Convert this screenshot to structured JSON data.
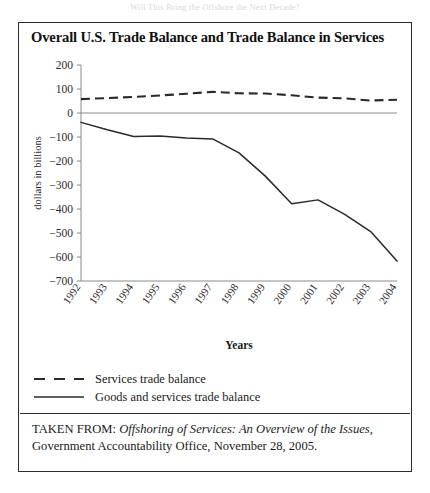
{
  "running_header": "Will This Bring the Offshore the Next Decade?",
  "figure": {
    "title": "Overall U.S. Trade Balance and Trade Balance in Services",
    "caption_prefix": "TAKEN FROM: ",
    "caption_source_title": "Offshoring of Services: An Overview of the Issues,",
    "caption_rest": "Government Accountability Office, November 28, 2005."
  },
  "legend": {
    "position": "below-plot",
    "items": [
      {
        "label": "Services trade balance",
        "style": "dashed",
        "color": "#2a2a2a"
      },
      {
        "label": "Goods and services trade balance",
        "style": "solid",
        "color": "#2a2a2a"
      }
    ]
  },
  "chart_data": {
    "type": "line",
    "title": "Overall U.S. Trade Balance and Trade Balance in Services",
    "xlabel": "Years",
    "ylabel": "dollars in billions",
    "x": [
      1992,
      1993,
      1994,
      1995,
      1996,
      1997,
      1998,
      1999,
      2000,
      2001,
      2002,
      2003,
      2004
    ],
    "xtick_labels": [
      "1992",
      "1993",
      "1994",
      "1995",
      "1996",
      "1997",
      "1998",
      "1999",
      "2000",
      "2001",
      "2002",
      "2003",
      "2004"
    ],
    "ytick_labels": [
      "200",
      "100",
      "0",
      "−100",
      "−200",
      "−300",
      "−400",
      "−500",
      "−600",
      "−700"
    ],
    "yticks": [
      200,
      100,
      0,
      -100,
      -200,
      -300,
      -400,
      -500,
      -600,
      -700
    ],
    "ylim": [
      -700,
      200
    ],
    "xlim": [
      1992,
      2004
    ],
    "grid": false,
    "series": [
      {
        "name": "Services trade balance",
        "style": "dashed",
        "values": [
          58,
          62,
          67,
          73,
          80,
          88,
          82,
          81,
          74,
          64,
          61,
          52,
          55
        ]
      },
      {
        "name": "Goods and services trade balance",
        "style": "solid",
        "values": [
          -39,
          -70,
          -98,
          -96,
          -104,
          -108,
          -166,
          -263,
          -378,
          -362,
          -421,
          -494,
          -617
        ]
      }
    ]
  }
}
